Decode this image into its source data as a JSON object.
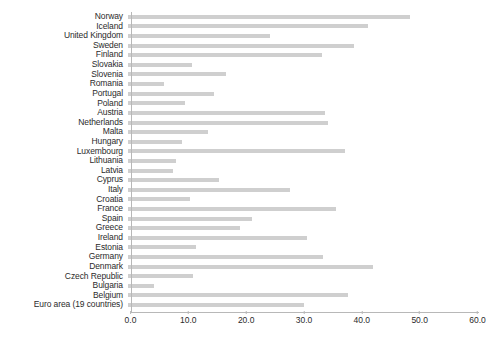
{
  "chart_data": {
    "type": "bar",
    "orientation": "horizontal",
    "title": "",
    "subtitle": "",
    "xlabel": "",
    "ylabel": "",
    "xlim": [
      0.0,
      60.0
    ],
    "xticks": [
      "0.0",
      "10.0",
      "20.0",
      "30.0",
      "40.0",
      "50.0",
      "60.0"
    ],
    "xtick_values": [
      0.0,
      10.0,
      20.0,
      30.0,
      40.0,
      50.0,
      60.0
    ],
    "grid": false,
    "legend": null,
    "bar_color": "#cfcfcf",
    "axis_color": "#b8b8b8",
    "text_color": "#2b2b2b",
    "categories": [
      "Norway",
      "Iceland",
      "United Kingdom",
      "Sweden",
      "Finland",
      "Slovakia",
      "Slovenia",
      "Romania",
      "Portugal",
      "Poland",
      "Austria",
      "Netherlands",
      "Malta",
      "Hungary",
      "Luxembourg",
      "Lithuania",
      "Latvia",
      "Cyprus",
      "Italy",
      "Croatia",
      "France",
      "Spain",
      "Greece",
      "Ireland",
      "Estonia",
      "Germany",
      "Denmark",
      "Czech Republic",
      "Bulgaria",
      "Belgium",
      "Euro area (19 countries)"
    ],
    "values": [
      48.8,
      41.5,
      24.5,
      39.0,
      33.5,
      11.0,
      17.0,
      6.3,
      14.8,
      9.8,
      34.0,
      34.5,
      13.8,
      9.3,
      37.5,
      8.3,
      7.8,
      15.8,
      28.0,
      10.8,
      36.0,
      21.5,
      19.3,
      31.0,
      11.8,
      33.8,
      42.3,
      11.3,
      4.5,
      38.0,
      30.5
    ]
  }
}
